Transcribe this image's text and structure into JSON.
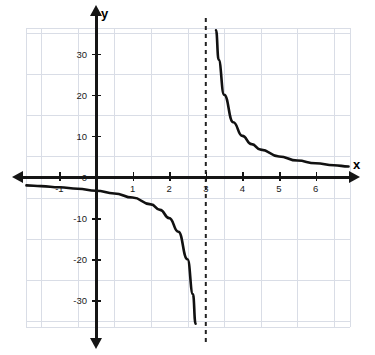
{
  "chart_data": {
    "type": "line",
    "title": "",
    "subtitle": "",
    "xlabel": "x",
    "ylabel": "y",
    "function": "y = 10/(x - 3)",
    "grid": true,
    "legend": null,
    "xlim": [
      -1.9,
      6.9
    ],
    "ylim": [
      -36,
      37
    ],
    "x_ticks": [
      -1,
      1,
      2,
      3,
      4,
      5,
      6
    ],
    "x_tick_labels": [
      "-1",
      "1",
      "2",
      "3",
      "4",
      "5",
      "6"
    ],
    "y_ticks": [
      -30,
      -20,
      -10,
      0,
      10,
      20,
      30
    ],
    "y_tick_labels": [
      "-30",
      "-20",
      "-10",
      "0",
      "10",
      "20",
      "30"
    ],
    "grid_x": [
      -1.5,
      -0.5,
      0.5,
      1.5,
      2.5,
      3.5,
      4.5,
      5.5,
      6.5
    ],
    "grid_y": [
      -35,
      -25,
      -15,
      -5,
      5,
      15,
      25,
      35
    ],
    "asymptotes": [
      {
        "name": "vertical-asymptote",
        "type": "vertical",
        "value": 3,
        "style": "dashed"
      }
    ],
    "annotations": [],
    "series": [
      {
        "name": "left-branch",
        "color": "#111111",
        "points": [
          {
            "x": -1.9,
            "y": -2.04
          },
          {
            "x": -1.5,
            "y": -2.22
          },
          {
            "x": -1.0,
            "y": -2.5
          },
          {
            "x": -0.5,
            "y": -2.86
          },
          {
            "x": 0.0,
            "y": -3.33
          },
          {
            "x": 0.5,
            "y": -4.0
          },
          {
            "x": 1.0,
            "y": -5.0
          },
          {
            "x": 1.5,
            "y": -6.67
          },
          {
            "x": 1.75,
            "y": -8.0
          },
          {
            "x": 2.0,
            "y": -10.0
          },
          {
            "x": 2.25,
            "y": -13.33
          },
          {
            "x": 2.5,
            "y": -20.0
          },
          {
            "x": 2.65,
            "y": -28.57
          },
          {
            "x": 2.72,
            "y": -35.7
          }
        ]
      },
      {
        "name": "right-branch",
        "color": "#111111",
        "points": [
          {
            "x": 3.28,
            "y": 35.7
          },
          {
            "x": 3.35,
            "y": 28.57
          },
          {
            "x": 3.5,
            "y": 20.0
          },
          {
            "x": 3.75,
            "y": 13.33
          },
          {
            "x": 4.0,
            "y": 10.0
          },
          {
            "x": 4.25,
            "y": 8.0
          },
          {
            "x": 4.5,
            "y": 6.67
          },
          {
            "x": 5.0,
            "y": 5.0
          },
          {
            "x": 5.5,
            "y": 4.0
          },
          {
            "x": 6.0,
            "y": 3.33
          },
          {
            "x": 6.5,
            "y": 2.86
          },
          {
            "x": 6.9,
            "y": 2.56
          }
        ]
      }
    ],
    "colors": {
      "curve": "#111111",
      "axis": "#151515",
      "grid": "#d9dde6",
      "asymptote": "#222222",
      "background": "#ffffff"
    }
  }
}
